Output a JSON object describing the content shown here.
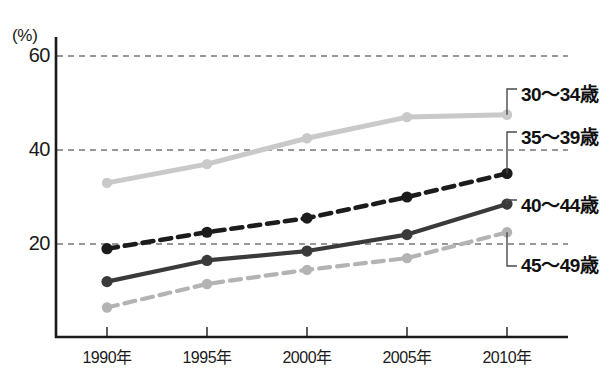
{
  "chart_data": {
    "type": "line",
    "title": "",
    "subtitle": "",
    "xlabel": "",
    "ylabel": "(%)",
    "unit_label": "(%)",
    "categories": [
      "1990年",
      "1995年",
      "2000年",
      "2005年",
      "2010年"
    ],
    "x_values": [
      1990,
      1995,
      2000,
      2005,
      2010
    ],
    "ylim": [
      0,
      62
    ],
    "xlim": [
      1988.2,
      2012.5
    ],
    "yticks": [
      "0",
      "20",
      "40",
      "60"
    ],
    "ytick_values": [
      0,
      20,
      40,
      60
    ],
    "grid": "horizontal-dashed",
    "legend_position": "right-inline-leader",
    "series": [
      {
        "name": "30〜34歳",
        "values": [
          33,
          37,
          42.5,
          47,
          47.5
        ],
        "color": "#c9c9c9",
        "style": "solid"
      },
      {
        "name": "35〜39歳",
        "values": [
          19,
          22.5,
          25.5,
          30,
          35
        ],
        "color": "#1c1c1c",
        "style": "dashed"
      },
      {
        "name": "40〜44歳",
        "values": [
          12,
          16.5,
          18.5,
          22,
          28.5
        ],
        "color": "#3a3a3a",
        "style": "solid"
      },
      {
        "name": "45〜49歳",
        "values": [
          6.5,
          11.5,
          14.5,
          17,
          22.5
        ],
        "color": "#b3b3b3",
        "style": "dashed"
      }
    ]
  },
  "axes": {
    "unit": "(%)",
    "y_ticks": [
      "60",
      "40",
      "20"
    ],
    "x_ticks": [
      "1990年",
      "1995年",
      "2000年",
      "2005年",
      "2010年"
    ]
  },
  "legend": {
    "items": [
      {
        "label": "30〜34歳"
      },
      {
        "label": "35〜39歳"
      },
      {
        "label": "40〜44歳"
      },
      {
        "label": "45〜49歳"
      }
    ]
  },
  "colors": {
    "axis": "#1a1a1a",
    "grid": "#333333",
    "series_30_34": "#c9c9c9",
    "series_35_39": "#1c1c1c",
    "series_40_44": "#3a3a3a",
    "series_45_49": "#b3b3b3",
    "background": "#ffffff"
  }
}
